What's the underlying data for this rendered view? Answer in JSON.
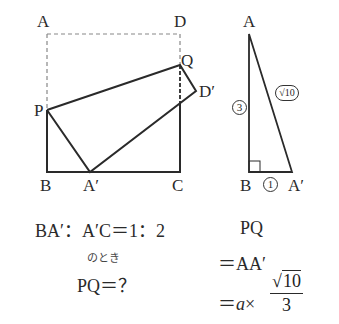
{
  "left_figure": {
    "labels": {
      "A": "A",
      "D": "D",
      "Q": "Q",
      "D_prime": "D′",
      "P": "P",
      "B": "B",
      "A_prime": "A′",
      "C": "C"
    },
    "colors": {
      "stroke": "#2a2a2a",
      "dashed": "#888888"
    }
  },
  "right_figure": {
    "labels": {
      "A": "A",
      "B": "B",
      "A_prime": "A′"
    },
    "side_labels": {
      "vertical": "3",
      "horizontal": "1",
      "hypotenuse": "√10"
    }
  },
  "condition": {
    "ratio": "BA′：A′C＝1：2",
    "when": "のとき",
    "question": "PQ＝？"
  },
  "solution": {
    "line1": "PQ",
    "line2": "＝AA′",
    "line3_prefix": "＝",
    "line3_var": "a",
    "line3_times": "×",
    "fraction_numerator_sqrt": "√",
    "fraction_numerator_value": "10",
    "fraction_denominator": "3"
  }
}
